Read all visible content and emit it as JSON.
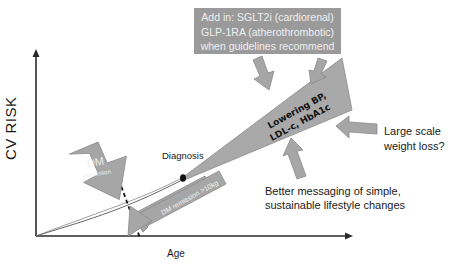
{
  "axes": {
    "y_label": "CV  RISK",
    "x_label": "Age"
  },
  "callouts": {
    "add_in": {
      "lines": [
        "Add in: SGLT2i (cardiorenal)",
        "GLP-1RA (atherothrombotic)",
        "when guidelines recommend"
      ]
    },
    "diagnosis": "Diagnosis",
    "wedge_label": {
      "line1": "Lowering BP,",
      "line2": "LDL-c, HbA1c"
    },
    "weight_loss": {
      "line1": "Large scale",
      "line2": "weight loss?"
    },
    "messaging": {
      "line1": "Better messaging of simple,",
      "line2": "sustainable lifestyle changes"
    },
    "dm_prevention": {
      "line1": "DM",
      "line2": "prevention"
    },
    "dm_remission": "DM remission >10kg"
  },
  "colors": {
    "arrow_fill": "#a6a6a6",
    "arrow_stroke": "#7a7a7a",
    "wedge_fill": "#a9a9a9",
    "axis": "#2a2a2a",
    "box_fill": "#9a9a9a"
  }
}
